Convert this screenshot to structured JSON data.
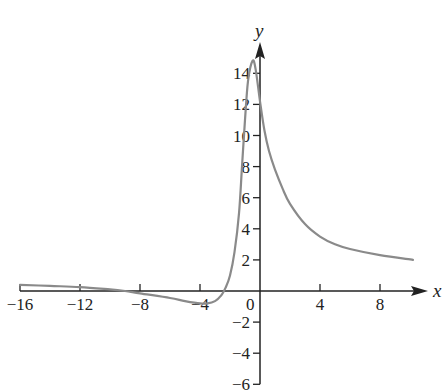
{
  "chart_data": {
    "type": "line",
    "title": "",
    "xlabel": "x",
    "ylabel": "y",
    "xlim": [
      -16,
      10.2
    ],
    "ylim": [
      -6,
      15.5
    ],
    "grid": false,
    "legend": null,
    "x_ticks": [
      -16,
      -12,
      -8,
      -4,
      0,
      4,
      8
    ],
    "x_tick_labels": [
      "−16",
      "−12",
      "−8",
      "−4",
      "0",
      "4",
      "8"
    ],
    "y_ticks": [
      -6,
      -4,
      -2,
      2,
      4,
      6,
      8,
      10,
      12,
      14
    ],
    "y_tick_labels": [
      "−6",
      "−4",
      "−2",
      "2",
      "4",
      "6",
      "8",
      "10",
      "12",
      "14"
    ],
    "origin_label": "0",
    "series": [
      {
        "name": "f(x)",
        "color": "#8a8a8a",
        "x": [
          -16,
          -14,
          -12,
          -10,
          -9,
          -8,
          -6,
          -5,
          -4,
          -3.5,
          -3,
          -2.6,
          -2.3,
          -2.0,
          -1.7,
          -1.4,
          -1.2,
          -1.0,
          -0.8,
          -0.5,
          -0.3,
          0,
          0.3,
          0.6,
          1.0,
          1.5,
          2,
          3,
          4,
          5,
          6,
          8,
          10.2
        ],
        "y": [
          0.4,
          0.33,
          0.25,
          0.1,
          0.0,
          -0.15,
          -0.45,
          -0.65,
          -0.8,
          -0.8,
          -0.65,
          -0.3,
          0.2,
          1.0,
          2.5,
          5.0,
          8.0,
          11.0,
          13.5,
          14.8,
          14.3,
          12.2,
          10.3,
          9.0,
          7.8,
          6.6,
          5.6,
          4.3,
          3.5,
          3.0,
          2.7,
          2.3,
          2.0
        ]
      }
    ]
  }
}
